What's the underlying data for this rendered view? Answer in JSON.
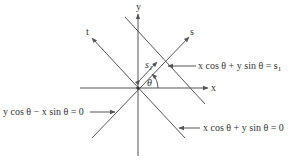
{
  "diagram": {
    "type": "coordinate-rotation-diagram",
    "axes": {
      "x_label": "x",
      "y_label": "y",
      "s_label": "s",
      "t_label": "t"
    },
    "angle_label": "θ",
    "offset_label": "s",
    "offset_subscript": "1",
    "equations": {
      "line_s1": "x cos θ + y sin θ = s",
      "line_s1_subscript": "1",
      "line_t_axis": "y cos θ − x sin θ = 0",
      "line_zero": "x cos θ + y sin θ = 0"
    },
    "colors": {
      "line": "#555555",
      "text": "#333333",
      "background": "#ffffff"
    }
  }
}
